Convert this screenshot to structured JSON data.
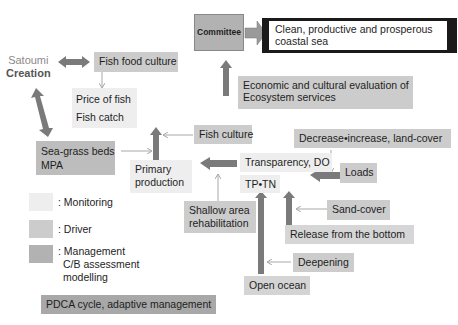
{
  "diagram": {
    "title_left": {
      "line1": "Satoumi",
      "line2": "Creation"
    },
    "committee": "Committee",
    "goal": {
      "line1": "Clean, productive and prosperous",
      "line2": "coastal sea"
    },
    "economic_eval": {
      "line1": "Economic and cultural evaluation of",
      "line2": "Ecosystem services"
    },
    "fish_food_culture": "Fish food culture",
    "price_of_fish": "Price of fish",
    "fish_catch": "Fish catch",
    "seagrass": {
      "line1": "Sea-grass beds",
      "line2": "MPA"
    },
    "fish_culture": "Fish culture",
    "primary_production": {
      "line1": "Primary",
      "line2": "production"
    },
    "decrease_increase": "Decrease•increase, land-cover",
    "transparency": "Transparency, DO",
    "loads": "Loads",
    "tp_tn": "TP•TN",
    "shallow_area": {
      "line1": "Shallow area",
      "line2": "rehabilitation"
    },
    "sand_cover": "Sand-cover",
    "release_bottom": "Release from the bottom",
    "deepening": "Deepening",
    "open_ocean": "Open ocean",
    "pdca": "PDCA cycle, adaptive management"
  },
  "legend": {
    "monitoring": ": Monitoring",
    "driver": ": Driver",
    "management": {
      "line1": ": Management",
      "line2": "C/B assessment",
      "line3": "modelling"
    }
  },
  "colors": {
    "monitoring": "#eeeeee",
    "driver": "#cccccc",
    "management": "#b2b2b2",
    "arrow_thick": "#7a7a7a",
    "arrow_thin": "#a8a8a8",
    "goal_border": "#1a1a1a"
  }
}
